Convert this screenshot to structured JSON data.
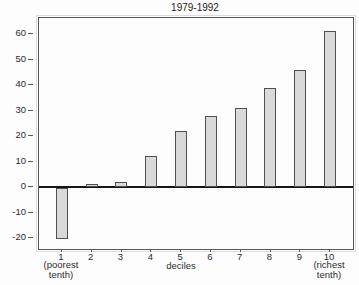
{
  "chart_data": {
    "type": "bar",
    "title": "1979-1992",
    "categories": [
      "1",
      "2",
      "3",
      "4",
      "5",
      "6",
      "7",
      "8",
      "9",
      "10"
    ],
    "values": [
      -20,
      1,
      2,
      12,
      22,
      28,
      31,
      39,
      46,
      61
    ],
    "xlabel": "deciles",
    "first_note": "(poorest\ntenth)",
    "last_note": "(richest\ntenth)",
    "yticks": [
      60,
      50,
      40,
      30,
      20,
      10,
      0,
      -10,
      -20
    ],
    "ylim": [
      -24,
      66
    ],
    "grid": false,
    "legend": false,
    "bar_fill": "#d9d9d9",
    "bar_border": "#4f4f4f",
    "axis_color": "#585858",
    "text_color": "#2b2b2b",
    "background": "#fdfdfd"
  }
}
